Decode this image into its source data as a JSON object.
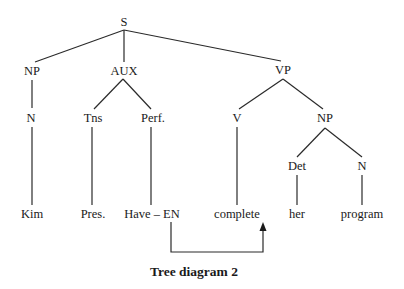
{
  "diagram": {
    "type": "syntax-tree",
    "caption": "Tree diagram 2",
    "nodes": [
      {
        "id": "S",
        "label": "S",
        "x": 124,
        "y": 26
      },
      {
        "id": "NP1",
        "label": "NP",
        "x": 32,
        "y": 75
      },
      {
        "id": "AUX",
        "label": "AUX",
        "x": 124,
        "y": 75
      },
      {
        "id": "VP",
        "label": "VP",
        "x": 283,
        "y": 74
      },
      {
        "id": "N1",
        "label": "N",
        "x": 31,
        "y": 122
      },
      {
        "id": "Tns",
        "label": "Tns",
        "x": 93,
        "y": 122
      },
      {
        "id": "Perf",
        "label": "Perf.",
        "x": 153,
        "y": 122
      },
      {
        "id": "V",
        "label": "V",
        "x": 237,
        "y": 122
      },
      {
        "id": "NP2",
        "label": "NP",
        "x": 325,
        "y": 122
      },
      {
        "id": "Det",
        "label": "Det",
        "x": 297,
        "y": 170
      },
      {
        "id": "N2",
        "label": "N",
        "x": 362,
        "y": 170
      },
      {
        "id": "Kim",
        "label": "Kim",
        "x": 32,
        "y": 218
      },
      {
        "id": "Pres",
        "label": "Pres.",
        "x": 93,
        "y": 218
      },
      {
        "id": "HaveEN",
        "label": "Have – EN",
        "x": 152,
        "y": 218
      },
      {
        "id": "complete",
        "label": "complete",
        "x": 237,
        "y": 218
      },
      {
        "id": "her",
        "label": "her",
        "x": 297,
        "y": 218
      },
      {
        "id": "program",
        "label": "program",
        "x": 362,
        "y": 218
      }
    ],
    "edges": [
      {
        "from": "S",
        "to": "NP1",
        "x1": 124,
        "y1": 30,
        "x2": 35,
        "y2": 62
      },
      {
        "from": "S",
        "to": "AUX",
        "x1": 124,
        "y1": 30,
        "x2": 124,
        "y2": 62
      },
      {
        "from": "S",
        "to": "VP",
        "x1": 124,
        "y1": 30,
        "x2": 281,
        "y2": 61
      },
      {
        "from": "NP1",
        "to": "N1",
        "x1": 32,
        "y1": 80,
        "x2": 32,
        "y2": 108
      },
      {
        "from": "AUX",
        "to": "Tns",
        "x1": 123,
        "y1": 79,
        "x2": 94,
        "y2": 109
      },
      {
        "from": "AUX",
        "to": "Perf",
        "x1": 123,
        "y1": 79,
        "x2": 151,
        "y2": 109
      },
      {
        "from": "VP",
        "to": "V",
        "x1": 283,
        "y1": 79,
        "x2": 239,
        "y2": 109
      },
      {
        "from": "VP",
        "to": "NP2",
        "x1": 283,
        "y1": 79,
        "x2": 323,
        "y2": 109
      },
      {
        "from": "N1",
        "to": "Kim",
        "x1": 32,
        "y1": 127,
        "x2": 32,
        "y2": 205
      },
      {
        "from": "Tns",
        "to": "Pres",
        "x1": 92,
        "y1": 127,
        "x2": 92,
        "y2": 205
      },
      {
        "from": "Perf",
        "to": "HaveEN",
        "x1": 151,
        "y1": 127,
        "x2": 151,
        "y2": 205
      },
      {
        "from": "V",
        "to": "complete",
        "x1": 237,
        "y1": 127,
        "x2": 237,
        "y2": 205
      },
      {
        "from": "NP2",
        "to": "Det",
        "x1": 325,
        "y1": 128,
        "x2": 297,
        "y2": 157
      },
      {
        "from": "NP2",
        "to": "N2",
        "x1": 325,
        "y1": 128,
        "x2": 362,
        "y2": 157
      },
      {
        "from": "Det",
        "to": "her",
        "x1": 297,
        "y1": 175,
        "x2": 297,
        "y2": 205
      },
      {
        "from": "N2",
        "to": "program",
        "x1": 362,
        "y1": 175,
        "x2": 362,
        "y2": 205
      }
    ],
    "movement_arrow": {
      "from": "HaveEN",
      "to": "complete",
      "description": "affix hopping: EN moves to complete",
      "points": [
        [
          171,
          222
        ],
        [
          171,
          252
        ],
        [
          263,
          252
        ],
        [
          263,
          230
        ]
      ],
      "arrowhead": {
        "tip": [
          263,
          222
        ],
        "left": [
          259.5,
          231
        ],
        "right": [
          266.5,
          231
        ]
      }
    },
    "caption_position": {
      "x": 194,
      "y": 276
    }
  }
}
